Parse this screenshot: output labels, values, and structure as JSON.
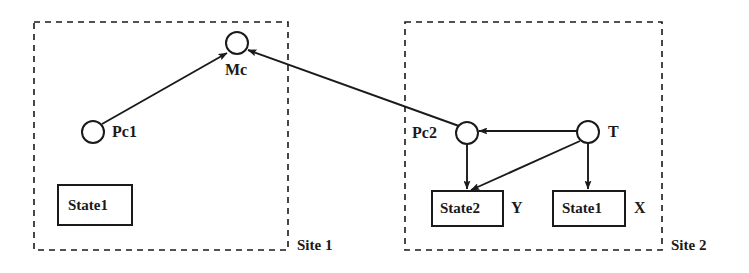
{
  "diagram": {
    "stroke_color": "#1a1a1a",
    "background_color": "#ffffff",
    "sites": [
      {
        "id": "site1",
        "label": "Site 1",
        "box": {
          "x": 34,
          "y": 22,
          "w": 254,
          "h": 228
        },
        "label_pos": {
          "x": 297,
          "y": 238
        }
      },
      {
        "id": "site2",
        "label": "Site 2",
        "box": {
          "x": 405,
          "y": 22,
          "w": 257,
          "h": 228
        },
        "label_pos": {
          "x": 671,
          "y": 238
        }
      }
    ],
    "circle_nodes": [
      {
        "id": "mc",
        "label": "Mc",
        "cx": 237,
        "cy": 43,
        "r": 11,
        "label_pos": {
          "x": 225,
          "y": 62
        }
      },
      {
        "id": "pc1",
        "label": "Pc1",
        "cx": 93,
        "cy": 132,
        "r": 11,
        "label_pos": {
          "x": 112,
          "y": 124
        }
      },
      {
        "id": "pc2",
        "label": "Pc2",
        "cx": 467,
        "cy": 133,
        "r": 11,
        "label_pos": {
          "x": 412,
          "y": 125
        }
      },
      {
        "id": "t",
        "label": "T",
        "cx": 588,
        "cy": 132,
        "r": 11,
        "label_pos": {
          "x": 608,
          "y": 124
        }
      }
    ],
    "box_nodes": [
      {
        "id": "state1_site1",
        "label": "State1",
        "x": 58,
        "y": 185,
        "w": 74,
        "h": 40,
        "var": "",
        "var_pos": null
      },
      {
        "id": "state2_site2",
        "label": "State2",
        "x": 432,
        "y": 191,
        "w": 71,
        "h": 35,
        "var": "Y",
        "var_pos": {
          "x": 511,
          "y": 200
        }
      },
      {
        "id": "state1_site2",
        "label": "State1",
        "x": 553,
        "y": 191,
        "w": 72,
        "h": 35,
        "var": "X",
        "var_pos": {
          "x": 634,
          "y": 200
        }
      }
    ],
    "edges": [
      {
        "id": "pc1-to-mc",
        "from": "pc1",
        "to": "mc",
        "x1": 102,
        "y1": 124,
        "x2": 227,
        "y2": 53
      },
      {
        "id": "pc2-to-mc",
        "from": "pc2",
        "to": "mc",
        "x1": 459,
        "y1": 126,
        "x2": 248,
        "y2": 50
      },
      {
        "id": "t-to-pc2",
        "from": "t",
        "to": "pc2",
        "x1": 577,
        "y1": 131,
        "x2": 479,
        "y2": 131
      },
      {
        "id": "pc2-to-state2",
        "from": "pc2",
        "to": "state2_site2",
        "x1": 467,
        "y1": 144,
        "x2": 467,
        "y2": 189
      },
      {
        "id": "t-to-state2",
        "from": "t",
        "to": "state2_site2",
        "x1": 580,
        "y1": 141,
        "x2": 471,
        "y2": 190
      },
      {
        "id": "t-to-state1",
        "from": "t",
        "to": "state1_site2",
        "x1": 588,
        "y1": 143,
        "x2": 588,
        "y2": 189
      }
    ]
  }
}
